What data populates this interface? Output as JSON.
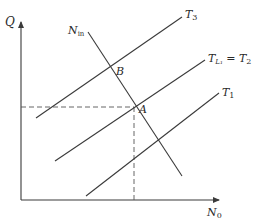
{
  "diagram": {
    "axes": {
      "y_label": "Q",
      "x_label": "N",
      "x_label_sub": "0"
    },
    "lines": [
      {
        "id": "T3",
        "label": "T",
        "label_sub": "3"
      },
      {
        "id": "TL1_eq_T2",
        "label": "T",
        "label_sub": "L₁",
        "label_suffix": " = T",
        "label_suffix_sub": "2"
      },
      {
        "id": "T1",
        "label": "T",
        "label_sub": "1"
      },
      {
        "id": "N_in",
        "label": "N",
        "label_sub": "in"
      }
    ],
    "points": [
      {
        "id": "B",
        "label": "B"
      },
      {
        "id": "A",
        "label": "A"
      }
    ],
    "guides": {
      "horizontal_dashed_to": "A",
      "vertical_dashed_to": "A"
    },
    "colors": {
      "line": "#3a3a3a",
      "axis": "#3a3a3a",
      "dashed": "#555555",
      "text": "#2a2a2a"
    }
  }
}
